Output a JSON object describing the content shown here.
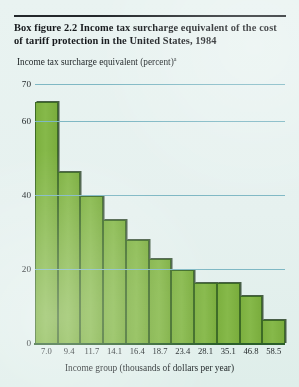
{
  "figure": {
    "title": "Box figure 2.2  Income tax surcharge equivalent of the cost of tariff protection in the United States, 1984",
    "footnote_marker": "a"
  },
  "colors": {
    "background": "#e8f2f0",
    "bar_fill": "#7cb03f",
    "bar_outline": "#3d6b25",
    "gridline": "#7fb8c4",
    "text": "#1a1a1a"
  },
  "chart_data": {
    "type": "bar",
    "title": "Box figure 2.2  Income tax surcharge equivalent of the cost of tariff protection in the United States, 1984",
    "xlabel": "Income group (thousands of dollars per year)",
    "ylabel": "Income tax surcharge equivalent (percent)",
    "categories": [
      "7.0",
      "9.4",
      "11.7",
      "14.1",
      "16.4",
      "18.7",
      "23.4",
      "28.1",
      "35.1",
      "46.8",
      "58.5"
    ],
    "values": [
      65.5,
      46.5,
      40.0,
      33.5,
      28.0,
      23.0,
      20.0,
      16.5,
      16.5,
      13.0,
      6.5
    ],
    "ylim": [
      0,
      70
    ],
    "yticks": [
      0,
      20,
      40,
      60,
      70
    ],
    "ytick_labels": [
      "0",
      "20",
      "40",
      "60",
      "70"
    ],
    "grid": true,
    "legend": "none"
  }
}
